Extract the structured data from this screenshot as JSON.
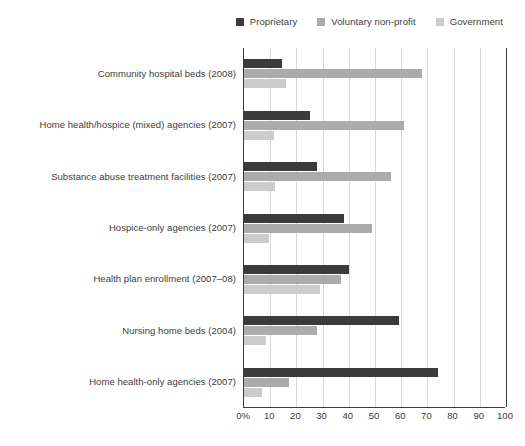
{
  "chart_data": {
    "type": "bar",
    "orientation": "horizontal",
    "title": "",
    "xlabel": "",
    "ylabel": "",
    "xlim": [
      0,
      100
    ],
    "xticks": [
      "0%",
      "10",
      "20",
      "30",
      "40",
      "50",
      "60",
      "70",
      "80",
      "90",
      "100"
    ],
    "xtick_values": [
      0,
      10,
      20,
      30,
      40,
      50,
      60,
      70,
      80,
      90,
      100
    ],
    "grid": true,
    "legend_position": "top-right",
    "categories": [
      "Community hospital beds (2008)",
      "Home health/hospice (mixed) agencies (2007)",
      "Substance abuse treatment facilities (2007)",
      "Hospice-only agencies (2007)",
      "Health plan enrollment (2007–08)",
      "Nursing home beds (2004)",
      "Home health-only agencies (2007)"
    ],
    "series": [
      {
        "name": "Proprietary",
        "color": "#3b3b3b",
        "values": [
          14.5,
          25,
          28,
          38,
          40,
          59,
          74
        ]
      },
      {
        "name": "Voluntary non-profit",
        "color": "#ababab",
        "values": [
          68,
          61,
          56,
          49,
          37,
          28,
          17
        ]
      },
      {
        "name": "Government",
        "color": "#cccccc",
        "values": [
          16,
          11.5,
          12,
          9.5,
          29,
          8.5,
          7
        ]
      }
    ]
  },
  "legend": {
    "items": [
      {
        "label": "Proprietary",
        "color": "#3b3b3b"
      },
      {
        "label": "Voluntary non-profit",
        "color": "#ababab"
      },
      {
        "label": "Government",
        "color": "#cccccc"
      }
    ]
  },
  "footnote": {
    "text": ""
  }
}
